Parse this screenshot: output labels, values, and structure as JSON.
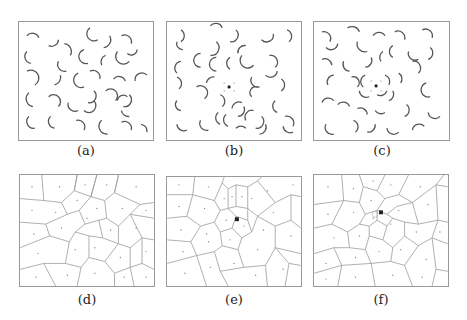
{
  "figure": {
    "panels": [
      {
        "id": "a",
        "caption": "(a)",
        "type": "arc-pattern",
        "center_marker": false
      },
      {
        "id": "b",
        "caption": "(b)",
        "type": "arc-pattern",
        "center_marker": true
      },
      {
        "id": "c",
        "caption": "(c)",
        "type": "arc-pattern",
        "center_marker": true
      },
      {
        "id": "d",
        "caption": "(d)",
        "type": "voronoi",
        "center_marker": false
      },
      {
        "id": "e",
        "caption": "(e)",
        "type": "voronoi",
        "center_marker": true
      },
      {
        "id": "f",
        "caption": "(f)",
        "type": "voronoi",
        "center_marker": true
      }
    ],
    "colors": {
      "frame": "#9a9a9a",
      "arc": "#555555",
      "edge": "#9a9a9a",
      "site": "#888888",
      "marker": "#222222"
    }
  }
}
